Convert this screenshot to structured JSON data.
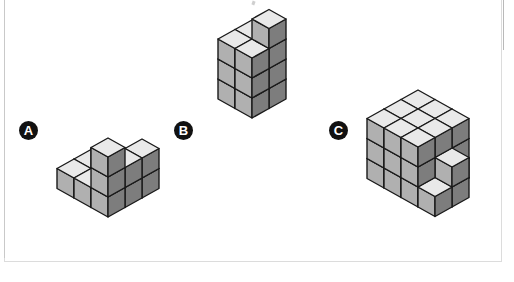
{
  "page": {
    "background_color": "#ffffff",
    "width": 514,
    "height": 282
  },
  "frame": {
    "border_color": "#dcdcdc",
    "left_rule_color": "#c9c9c9",
    "right_rule_color": "#b9b9b9"
  },
  "palette": {
    "top_face": "#e9e9e9",
    "left_face": "#b0b0b0",
    "right_face": "#7d7d7d",
    "outline": "#1a1a1a",
    "badge_fill": "#111111",
    "badge_text": "#ffffff"
  },
  "geometry": {
    "half_width": 17,
    "half_height": 9.5,
    "cube_height": 20
  },
  "labels": [
    {
      "id": "A",
      "text": "A",
      "x": 19,
      "y": 121
    },
    {
      "id": "B",
      "text": "B",
      "x": 174,
      "y": 121
    },
    {
      "id": "C",
      "text": "C",
      "x": 329,
      "y": 121
    }
  ],
  "structures": [
    {
      "id": "A",
      "name": "structure-a",
      "label": "A",
      "origin_x": 108,
      "origin_y": 160,
      "cube_count": 14,
      "description": "Stepped L / staircase arrangement of unit cubes",
      "voxels": [
        [
          0,
          0,
          0
        ],
        [
          1,
          0,
          0
        ],
        [
          2,
          0,
          0
        ],
        [
          0,
          1,
          0
        ],
        [
          1,
          1,
          0
        ],
        [
          2,
          1,
          0
        ],
        [
          0,
          2,
          0
        ],
        [
          1,
          2,
          0
        ],
        [
          2,
          2,
          0
        ],
        [
          1,
          1,
          1
        ],
        [
          2,
          1,
          1
        ],
        [
          2,
          2,
          1
        ],
        [
          2,
          0,
          1
        ],
        [
          2,
          2,
          2
        ]
      ]
    },
    {
      "id": "B",
      "name": "structure-b",
      "label": "B",
      "origin_x": 252,
      "origin_y": 80,
      "cube_count": 13,
      "description": "Two by two by three tower with one extra cube on top",
      "voxels": [
        [
          0,
          0,
          0
        ],
        [
          1,
          0,
          0
        ],
        [
          0,
          1,
          0
        ],
        [
          1,
          1,
          0
        ],
        [
          0,
          0,
          1
        ],
        [
          1,
          0,
          1
        ],
        [
          0,
          1,
          1
        ],
        [
          1,
          1,
          1
        ],
        [
          0,
          0,
          2
        ],
        [
          1,
          0,
          2
        ],
        [
          0,
          1,
          2
        ],
        [
          1,
          1,
          2
        ],
        [
          1,
          0,
          3
        ]
      ]
    },
    {
      "id": "C",
      "name": "structure-c",
      "label": "C",
      "origin_x": 418,
      "origin_y": 150,
      "cube_count": 30,
      "description": "Three by three by three block with stepped right side extension",
      "voxels": [
        [
          0,
          0,
          0
        ],
        [
          1,
          0,
          0
        ],
        [
          2,
          0,
          0
        ],
        [
          0,
          1,
          0
        ],
        [
          1,
          1,
          0
        ],
        [
          2,
          1,
          0
        ],
        [
          0,
          2,
          0
        ],
        [
          1,
          2,
          0
        ],
        [
          2,
          2,
          0
        ],
        [
          0,
          0,
          1
        ],
        [
          1,
          0,
          1
        ],
        [
          2,
          0,
          1
        ],
        [
          0,
          1,
          1
        ],
        [
          1,
          1,
          1
        ],
        [
          2,
          1,
          1
        ],
        [
          0,
          2,
          1
        ],
        [
          1,
          2,
          1
        ],
        [
          2,
          2,
          1
        ],
        [
          0,
          0,
          2
        ],
        [
          1,
          0,
          2
        ],
        [
          2,
          0,
          2
        ],
        [
          0,
          1,
          2
        ],
        [
          1,
          1,
          2
        ],
        [
          2,
          1,
          2
        ],
        [
          0,
          2,
          2
        ],
        [
          1,
          2,
          2
        ],
        [
          2,
          2,
          2
        ],
        [
          3,
          2,
          0
        ],
        [
          3,
          1,
          0
        ],
        [
          3,
          1,
          1
        ]
      ]
    }
  ]
}
